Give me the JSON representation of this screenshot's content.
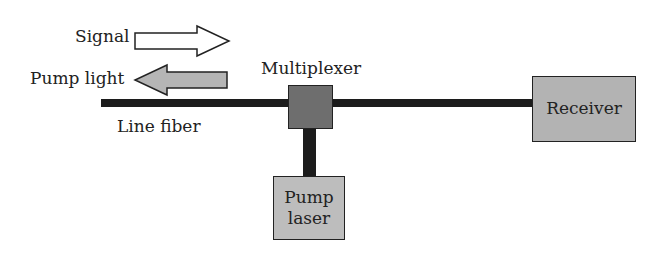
{
  "diagram": {
    "labels": {
      "signal": "Signal",
      "pump_light": "Pump light",
      "line_fiber": "Line fiber",
      "multiplexer": "Multiplexer"
    },
    "boxes": {
      "receiver": "Receiver",
      "pump_laser_line1": "Pump",
      "pump_laser_line2": "laser"
    },
    "arrows": [
      {
        "name": "signal",
        "direction": "right",
        "fill": "#ffffff"
      },
      {
        "name": "pump_light",
        "direction": "left",
        "fill": "#b5b5b5"
      }
    ],
    "colors": {
      "fiber": "#1c1c1c",
      "multiplexer": "#6e6e6e",
      "receiver": "#b3b3b3",
      "pump_laser": "#bdbdbd"
    }
  }
}
